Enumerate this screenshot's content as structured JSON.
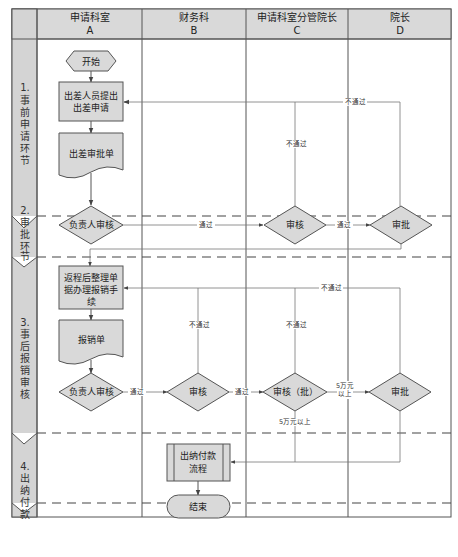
{
  "header": {
    "columns": [
      {
        "name": "申请科室",
        "code": "A"
      },
      {
        "name": "财务科",
        "code": "B"
      },
      {
        "name": "申请科室分管院长",
        "code": "C"
      },
      {
        "name": "院长",
        "code": "D"
      }
    ]
  },
  "stages": [
    {
      "number": "1.",
      "chars": [
        "事",
        "前",
        "申",
        "请",
        "环",
        "节"
      ]
    },
    {
      "number": "2.",
      "chars": [
        "审",
        "批",
        "环",
        "节"
      ]
    },
    {
      "number": "3.",
      "chars": [
        "事",
        "后",
        "报",
        "销",
        "审",
        "核"
      ]
    },
    {
      "number": "4.",
      "chars": [
        "出",
        "纳",
        "付",
        "款"
      ]
    }
  ],
  "nodes": {
    "start": "开始",
    "submit_line1": "出差人员提出",
    "submit_line2": "出差申请",
    "form1": "出差审批单",
    "review_a1": "负责人审核",
    "review_c1": "审核",
    "approve_d1": "审批",
    "reimburse_line1": "返程后整理单",
    "reimburse_line2": "据办理报销手",
    "reimburse_line3": "续",
    "form2": "报销单",
    "review_a2": "负责人审核",
    "review_b": "审核",
    "review_c2": "审核（批）",
    "approve_d2": "审批",
    "cashier_line1": "出纳付款",
    "cashier_line2": "流程",
    "end": "结束"
  },
  "edge_labels": {
    "pass": "通过",
    "fail": "不通过",
    "over_50k_line1": "5万元",
    "over_50k_line2": "以上",
    "over_50k": "5万元以上"
  },
  "colors": {
    "shape_fill": "#d9d9d9",
    "header_fill": "#d9d9d9",
    "stroke": "#555555",
    "lane_fill": "#d4d4d4"
  }
}
